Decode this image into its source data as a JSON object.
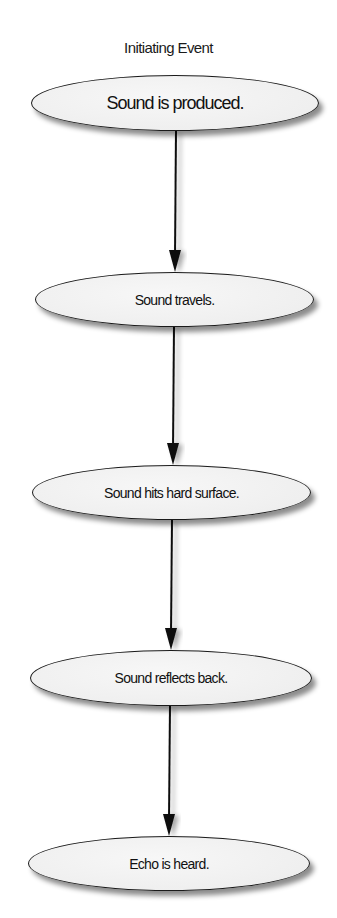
{
  "diagram": {
    "type": "flowchart",
    "direction": "top-to-bottom",
    "title": "Initiating Event",
    "colors": {
      "outline": "#1a1a1a",
      "fill": "#efefef",
      "background": "#ffffff",
      "arrow": "#111111"
    },
    "nodes": [
      {
        "id": "n1",
        "shape": "ellipse",
        "label": "Sound is produced."
      },
      {
        "id": "n2",
        "shape": "ellipse",
        "label": "Sound travels."
      },
      {
        "id": "n3",
        "shape": "ellipse",
        "label": "Sound hits hard surface."
      },
      {
        "id": "n4",
        "shape": "ellipse",
        "label": "Sound reflects back."
      },
      {
        "id": "n5",
        "shape": "ellipse",
        "label": "Echo is heard."
      }
    ],
    "edges": [
      {
        "from": "n1",
        "to": "n2",
        "style": "arrow"
      },
      {
        "from": "n2",
        "to": "n3",
        "style": "arrow"
      },
      {
        "from": "n3",
        "to": "n4",
        "style": "arrow"
      },
      {
        "from": "n4",
        "to": "n5",
        "style": "arrow"
      }
    ]
  }
}
